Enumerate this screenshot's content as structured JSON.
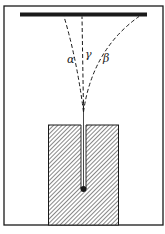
{
  "diagram": {
    "colors": {
      "ink": "#1a1a1a",
      "background": "#ffffff",
      "hatch": "#555555"
    },
    "labels": {
      "alpha": "α",
      "gamma": "γ",
      "beta": "β"
    },
    "components": {
      "frame": "enclosure",
      "plate": "detector-plate",
      "block": "lead-block",
      "source": "radioactive-source"
    }
  }
}
